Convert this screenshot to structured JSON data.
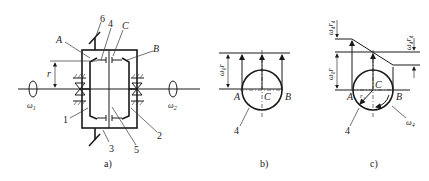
{
  "figure": {
    "panels": [
      {
        "id": "a",
        "caption": "a)",
        "labels": {
          "A": "A",
          "B": "B",
          "C": "C",
          "r": "r",
          "omega1": "ω",
          "omega1_sub": "1",
          "omega2": "ω",
          "omega2_sub": "2",
          "n1": "1",
          "n2": "2",
          "n3": "3",
          "n4": "4",
          "n5": "5",
          "n6": "6"
        }
      },
      {
        "id": "b",
        "caption": "b)",
        "labels": {
          "A": "A",
          "B": "B",
          "C": "C",
          "n4": "4",
          "omega0r": "ω₀r"
        }
      },
      {
        "id": "c",
        "caption": "c)",
        "labels": {
          "A": "A",
          "B": "B",
          "C": "C",
          "n4": "4",
          "omega0r": "ω₀r",
          "omega4r4_top": "ω₄r₄",
          "omega4r4_right": "ω₄r₄",
          "r4": "r₄",
          "omega4": "ω",
          "omega4_sub": "4"
        }
      }
    ]
  }
}
